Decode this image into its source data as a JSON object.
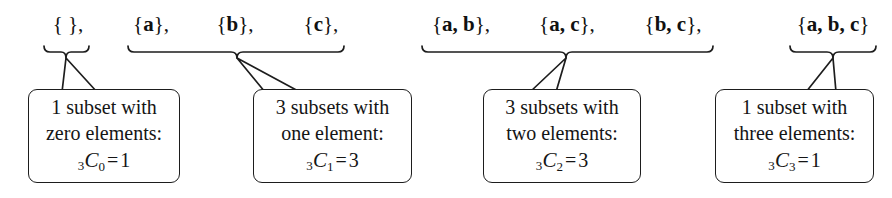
{
  "figure": {
    "background_color": "#ffffff",
    "stroke_color": "#1d1d1d"
  },
  "groups": [
    {
      "id": "zero-elements",
      "sets_text": "{ },",
      "brace": {
        "x_start": 44,
        "x_end": 89,
        "peak_x": 66,
        "y": 52
      },
      "callout": {
        "line1": "1 subset with",
        "line2": "zero elements:",
        "formula": {
          "presub": "3",
          "symbol": "C",
          "sub": "0",
          "equals": "=",
          "value": "1",
          "full_text": "3C0 = 1"
        }
      }
    },
    {
      "id": "one-element",
      "sets_text": "{a},      {b},      {c},",
      "brace": {
        "x_start": 128,
        "x_end": 344,
        "peak_x": 237,
        "y": 52
      },
      "callout": {
        "line1": "3 subsets with",
        "line2": "one element:",
        "formula": {
          "presub": "3",
          "symbol": "C",
          "sub": "1",
          "equals": "=",
          "value": "3",
          "full_text": "3C1 = 3"
        }
      }
    },
    {
      "id": "two-elements",
      "sets_text": "{a, b},      {a, c},      {b, c},",
      "brace": {
        "x_start": 422,
        "x_end": 713,
        "peak_x": 566,
        "y": 52
      },
      "callout": {
        "line1": "3 subsets with",
        "line2": "two elements:",
        "formula": {
          "presub": "3",
          "symbol": "C",
          "sub": "2",
          "equals": "=",
          "value": "3",
          "full_text": "3C2 = 3"
        }
      }
    },
    {
      "id": "three-elements",
      "sets_text": "{a, b, c}",
      "brace": {
        "x_start": 790,
        "x_end": 876,
        "peak_x": 833,
        "y": 52
      },
      "callout": {
        "line1": "1 subset with",
        "line2": "three elements:",
        "formula": {
          "presub": "3",
          "symbol": "C",
          "sub": "3",
          "equals": "=",
          "value": "1",
          "full_text": "3C3 = 1"
        }
      }
    }
  ],
  "set_labels": {
    "empty": {
      "open": "{",
      "space": " ",
      "close": "},",
      "elements": []
    },
    "a": {
      "open": "{",
      "element": "a",
      "close": "},"
    },
    "b": {
      "open": "{",
      "element": "b",
      "close": "},"
    },
    "c": {
      "open": "{",
      "element": "c",
      "close": "},"
    },
    "ab": {
      "open": "{",
      "element": "a, b",
      "close": "},"
    },
    "ac": {
      "open": "{",
      "element": "a, c",
      "close": "},"
    },
    "bc": {
      "open": "{",
      "element": "b, c",
      "close": "},"
    },
    "abc": {
      "open": "{",
      "element": "a, b, c",
      "close": "}"
    }
  }
}
